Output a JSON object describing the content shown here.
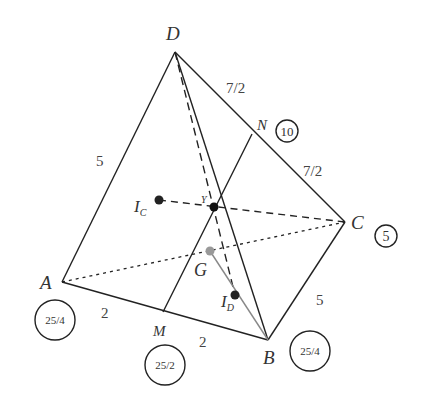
{
  "diagram": {
    "type": "tetrahedron",
    "vertices": {
      "D": {
        "label": "D",
        "x": 175,
        "y": 52
      },
      "A": {
        "label": "A",
        "x": 62,
        "y": 282
      },
      "B": {
        "label": "B",
        "x": 268,
        "y": 340
      },
      "C": {
        "label": "C",
        "x": 345,
        "y": 222
      }
    },
    "points": {
      "M": {
        "label": "M",
        "x": 163,
        "y": 312
      },
      "N": {
        "label": "N",
        "x": 252,
        "y": 134
      },
      "Y": {
        "label": "Y",
        "x": 214,
        "y": 207
      },
      "IC": {
        "label": "I",
        "sub": "C",
        "x": 159,
        "y": 200
      },
      "G": {
        "label": "G",
        "x": 210,
        "y": 251
      },
      "ID": {
        "label": "I",
        "sub": "D",
        "x": 235,
        "y": 295
      }
    },
    "edge_labels": {
      "DA": "5",
      "DN": "7/2",
      "NC": "7/2",
      "CB": "5",
      "AM": "2",
      "MB": "2"
    },
    "weights": {
      "A": "25/4",
      "M": "25/2",
      "B": "25/4",
      "C": "5",
      "N": "10"
    },
    "colors": {
      "line": "#222222",
      "gray_line": "#888888",
      "point_dark": "#222222",
      "point_gray": "#999999"
    }
  }
}
